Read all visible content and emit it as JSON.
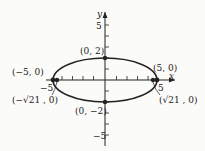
{
  "diagram": {
    "axes": {
      "x_label": "x",
      "y_label": "y",
      "y_tick_top": "5",
      "y_tick_bottom": "−5",
      "x_tick_left": "−5",
      "x_tick_right": "5"
    },
    "points": [
      {
        "label": "(0, 2)"
      },
      {
        "label": "(−5, 0)"
      },
      {
        "label": "(5, 0)"
      },
      {
        "label": "(−√21 , 0)"
      },
      {
        "label": "(√21 , 0)"
      },
      {
        "label": "(0, −2)"
      }
    ],
    "colors": {
      "ink": "#222222",
      "background": "#fbfbf9"
    }
  }
}
